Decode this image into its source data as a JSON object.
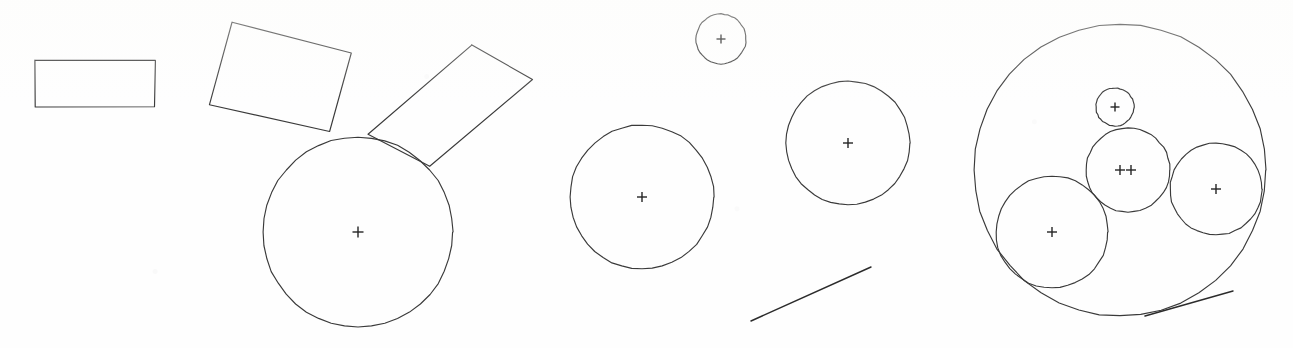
{
  "page": {
    "width": 1293,
    "height": 348,
    "background_color": "#fefefe",
    "ink_color": "#3a3a3a",
    "marker_color": "#242424"
  },
  "groups": [
    {
      "name": "left-cluster",
      "label": "Left cluster: axis-aligned rectangle, two tilted rectangles and a large circle"
    },
    {
      "name": "middle-cluster",
      "label": "Middle cluster: three circles and a line segment"
    },
    {
      "name": "right-cluster",
      "label": "Right cluster: large circle containing four circles and a line segment"
    }
  ],
  "shapes": {
    "rectangles": [
      {
        "name": "rectangle-axis-aligned",
        "group": "left-cluster",
        "points": "35,60 155,60 155,107 35,107",
        "rotation_deg": 0
      },
      {
        "name": "rectangle-tilted-upper-left",
        "group": "left-cluster",
        "points": "232,22 351,53 330,132 209,105",
        "rotation_deg": 15
      },
      {
        "name": "rectangle-tilted-upper-right",
        "group": "left-cluster",
        "points": "472,45 533,79 430,166 368,134",
        "rotation_deg": -40
      }
    ],
    "circles": [
      {
        "name": "circle-left-large",
        "group": "left-cluster",
        "cx": 358,
        "cy": 232,
        "r": 95,
        "marker": "cross"
      },
      {
        "name": "circle-middle-small-top",
        "group": "middle-cluster",
        "cx": 721,
        "cy": 39,
        "r": 25,
        "marker": "cross"
      },
      {
        "name": "circle-middle-left",
        "group": "middle-cluster",
        "cx": 642,
        "cy": 197,
        "r": 72,
        "marker": "cross"
      },
      {
        "name": "circle-middle-right",
        "group": "middle-cluster",
        "cx": 848,
        "cy": 143,
        "r": 62,
        "marker": "cross"
      },
      {
        "name": "circle-right-outer-large",
        "group": "right-cluster",
        "cx": 1120,
        "cy": 170,
        "r": 146,
        "marker": "none"
      },
      {
        "name": "circle-right-small-top",
        "group": "right-cluster",
        "cx": 1115,
        "cy": 107,
        "r": 19,
        "marker": "cross"
      },
      {
        "name": "circle-right-center",
        "group": "right-cluster",
        "cx": 1128,
        "cy": 170,
        "r": 42,
        "marker": "double-cross"
      },
      {
        "name": "circle-right-lower-left",
        "group": "right-cluster",
        "cx": 1052,
        "cy": 232,
        "r": 56,
        "marker": "cross"
      },
      {
        "name": "circle-right-east",
        "group": "right-cluster",
        "cx": 1216,
        "cy": 189,
        "r": 46,
        "marker": "cross"
      }
    ],
    "lines": [
      {
        "name": "line-middle-diagonal",
        "group": "middle-cluster",
        "x1": 751,
        "y1": 321,
        "x2": 871,
        "y2": 267
      },
      {
        "name": "line-right-diagonal",
        "group": "right-cluster",
        "x1": 1145,
        "y1": 316,
        "x2": 1233,
        "y2": 291
      }
    ],
    "markers": [
      {
        "name": "cross-marker-circle-left-large",
        "cx": 358,
        "cy": 232,
        "size": 11
      },
      {
        "name": "cross-marker-circle-middle-small-top",
        "cx": 721,
        "cy": 39,
        "size": 9
      },
      {
        "name": "cross-marker-circle-middle-left",
        "cx": 642,
        "cy": 197,
        "size": 10
      },
      {
        "name": "cross-marker-circle-middle-right",
        "cx": 848,
        "cy": 143,
        "size": 10
      },
      {
        "name": "cross-marker-circle-right-small-top",
        "cx": 1115,
        "cy": 107,
        "size": 9
      },
      {
        "name": "cross-marker-circle-right-center-a",
        "cx": 1120,
        "cy": 170,
        "size": 10
      },
      {
        "name": "cross-marker-circle-right-center-b",
        "cx": 1131,
        "cy": 170,
        "size": 10
      },
      {
        "name": "cross-marker-circle-right-lower-left",
        "cx": 1052,
        "cy": 232,
        "size": 10
      },
      {
        "name": "cross-marker-circle-right-east",
        "cx": 1216,
        "cy": 189,
        "size": 10
      }
    ]
  },
  "counts": {
    "rectangles": 3,
    "circles": 9,
    "lines": 2,
    "cross_markers": 9
  }
}
